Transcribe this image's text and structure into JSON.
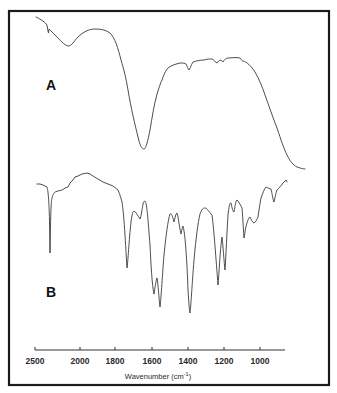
{
  "chart_data": {
    "type": "line",
    "title": "",
    "xlabel": "Wavenumber (cm⁻¹)",
    "ylabel": "",
    "xlim": [
      2500,
      850
    ],
    "x_axis_reversed": true,
    "x_scale_note": "Scale compresses between 2500 and 2000; expanded below 2000",
    "xticks": [
      2500,
      2000,
      1800,
      1600,
      1400,
      1200,
      1000
    ],
    "grid": false,
    "legend": "none",
    "series": [
      {
        "name": "A",
        "description": "Broad spectrum with strong band near 1640 cm-1 and steep rise below 1050 cm-1",
        "points": [
          {
            "x": 2480,
            "y_rel": 0.95
          },
          {
            "x": 2360,
            "y_rel": 0.86
          },
          {
            "x": 2050,
            "y_rel": 0.78
          },
          {
            "x": 1920,
            "y_rel": 0.89
          },
          {
            "x": 1840,
            "y_rel": 0.87
          },
          {
            "x": 1760,
            "y_rel": 0.62
          },
          {
            "x": 1640,
            "y_rel": 0.15
          },
          {
            "x": 1540,
            "y_rel": 0.62
          },
          {
            "x": 1430,
            "y_rel": 0.68
          },
          {
            "x": 1385,
            "y_rel": 0.64
          },
          {
            "x": 1290,
            "y_rel": 0.71
          },
          {
            "x": 1240,
            "y_rel": 0.68
          },
          {
            "x": 1160,
            "y_rel": 0.71
          },
          {
            "x": 1100,
            "y_rel": 0.66
          },
          {
            "x": 1010,
            "y_rel": 0.45
          },
          {
            "x": 900,
            "y_rel": 0.05
          }
        ]
      },
      {
        "name": "B",
        "description": "Sharp band spectrum with many absorption minima",
        "points": [
          {
            "x": 2480,
            "y_rel": 0.95
          },
          {
            "x": 2330,
            "y_rel": 0.15
          },
          {
            "x": 2250,
            "y_rel": 0.88
          },
          {
            "x": 1960,
            "y_rel": 0.98
          },
          {
            "x": 1760,
            "y_rel": 0.85
          },
          {
            "x": 1735,
            "y_rel": 0.35
          },
          {
            "x": 1690,
            "y_rel": 0.75
          },
          {
            "x": 1660,
            "y_rel": 0.72
          },
          {
            "x": 1630,
            "y_rel": 0.82
          },
          {
            "x": 1580,
            "y_rel": 0.12
          },
          {
            "x": 1560,
            "y_rel": 0.04
          },
          {
            "x": 1500,
            "y_rel": 0.7
          },
          {
            "x": 1460,
            "y_rel": 0.7
          },
          {
            "x": 1440,
            "y_rel": 0.58
          },
          {
            "x": 1380,
            "y_rel": 0.02
          },
          {
            "x": 1300,
            "y_rel": 0.77
          },
          {
            "x": 1230,
            "y_rel": 0.2
          },
          {
            "x": 1210,
            "y_rel": 0.55
          },
          {
            "x": 1200,
            "y_rel": 0.3
          },
          {
            "x": 1170,
            "y_rel": 0.8
          },
          {
            "x": 1150,
            "y_rel": 0.8
          },
          {
            "x": 1130,
            "y_rel": 0.58
          },
          {
            "x": 1080,
            "y_rel": 0.67
          },
          {
            "x": 1050,
            "y_rel": 0.9
          },
          {
            "x": 1000,
            "y_rel": 0.9
          },
          {
            "x": 960,
            "y_rel": 0.82
          },
          {
            "x": 880,
            "y_rel": 0.97
          }
        ]
      }
    ]
  },
  "labels": {
    "panel_a": "A",
    "panel_b": "B",
    "xlabel": "Wavenumber (cm",
    "xlabel_sup": "-1",
    "xlabel_end": ")"
  },
  "axis": {
    "ticks": [
      {
        "label": "2500",
        "x": 35
      },
      {
        "label": "2000",
        "x": 80
      },
      {
        "label": "1800",
        "x": 115
      },
      {
        "label": "1600",
        "x": 152
      },
      {
        "label": "1400",
        "x": 188
      },
      {
        "label": "1200",
        "x": 224
      },
      {
        "label": "1000",
        "x": 260
      }
    ]
  }
}
